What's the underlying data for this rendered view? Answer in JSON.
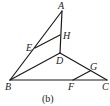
{
  "figure": {
    "caption": "(b)",
    "points": {
      "A": {
        "label": "A",
        "x": 62,
        "y": 11
      },
      "H": {
        "label": "H",
        "x": 60,
        "y": 35
      },
      "E": {
        "label": "E",
        "x": 35,
        "y": 48
      },
      "D": {
        "label": "D",
        "x": 60,
        "y": 53
      },
      "G": {
        "label": "G",
        "x": 90,
        "y": 71
      },
      "B": {
        "label": "B",
        "x": 10,
        "y": 80
      },
      "F": {
        "label": "F",
        "x": 73,
        "y": 80
      },
      "C": {
        "label": "C",
        "x": 107,
        "y": 80
      }
    },
    "segments": [
      "AB",
      "AD",
      "EH",
      "BD",
      "DC",
      "BC",
      "FG"
    ]
  }
}
